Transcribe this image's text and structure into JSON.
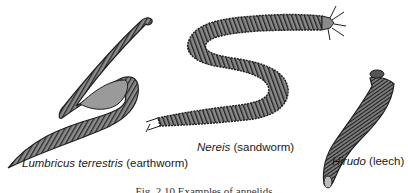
{
  "figure": {
    "specimens": [
      {
        "genus": "Lumbricus terrestris",
        "common": "(earthworm)"
      },
      {
        "genus": "Nereis",
        "common": "(sandworm)"
      },
      {
        "genus": "Hirudo",
        "common": "(leech)"
      }
    ],
    "caption": "Fig. 2.10  Examples of annelids",
    "colors": {
      "body_fill": "#8c8c8c",
      "outline": "#1e1e1e",
      "segment_line": "#2a2a2a",
      "background": "#ffffff"
    }
  }
}
